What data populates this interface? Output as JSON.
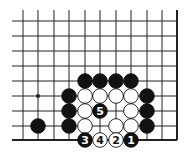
{
  "diagram": {
    "type": "go-board-fragment",
    "grid": {
      "x_lines": [
        23,
        38,
        54,
        69,
        85,
        100,
        116,
        131,
        147,
        162,
        177
      ],
      "y_lines": [
        21,
        36,
        51,
        66,
        81,
        96,
        111,
        126,
        140
      ],
      "left_extent": 12,
      "top_extent": 10,
      "right_edge_col": 10,
      "bottom_edge_row": 8
    },
    "star_points": [
      {
        "col": 1,
        "row": 5
      }
    ],
    "stones": [
      {
        "col": 4,
        "row": 4,
        "color": "black",
        "label": ""
      },
      {
        "col": 5,
        "row": 4,
        "color": "black",
        "label": ""
      },
      {
        "col": 6,
        "row": 4,
        "color": "black",
        "label": ""
      },
      {
        "col": 7,
        "row": 4,
        "color": "black",
        "label": ""
      },
      {
        "col": 3,
        "row": 5,
        "color": "black",
        "label": ""
      },
      {
        "col": 4,
        "row": 5,
        "color": "white",
        "label": ""
      },
      {
        "col": 5,
        "row": 5,
        "color": "white",
        "label": ""
      },
      {
        "col": 6,
        "row": 5,
        "color": "white",
        "label": ""
      },
      {
        "col": 7,
        "row": 5,
        "color": "white",
        "label": ""
      },
      {
        "col": 8,
        "row": 5,
        "color": "black",
        "label": ""
      },
      {
        "col": 3,
        "row": 6,
        "color": "black",
        "label": ""
      },
      {
        "col": 4,
        "row": 6,
        "color": "white",
        "label": ""
      },
      {
        "col": 5,
        "row": 6,
        "color": "black",
        "label": "5"
      },
      {
        "col": 7,
        "row": 6,
        "color": "white",
        "label": ""
      },
      {
        "col": 8,
        "row": 6,
        "color": "black",
        "label": ""
      },
      {
        "col": 1,
        "row": 7,
        "color": "black",
        "label": ""
      },
      {
        "col": 3,
        "row": 7,
        "color": "black",
        "label": ""
      },
      {
        "col": 4,
        "row": 7,
        "color": "white",
        "label": ""
      },
      {
        "col": 6,
        "row": 7,
        "color": "white",
        "label": ""
      },
      {
        "col": 7,
        "row": 7,
        "color": "white",
        "label": ""
      },
      {
        "col": 8,
        "row": 7,
        "color": "black",
        "label": ""
      },
      {
        "col": 4,
        "row": 8,
        "color": "black",
        "label": "3"
      },
      {
        "col": 5,
        "row": 8,
        "color": "white",
        "label": "4"
      },
      {
        "col": 6,
        "row": 8,
        "color": "white",
        "label": "2"
      },
      {
        "col": 7,
        "row": 8,
        "color": "black",
        "label": "1"
      }
    ],
    "colors": {
      "line": "#222222",
      "black_stone": "#111111",
      "white_stone": "#ffffff",
      "background": "#ffffff"
    }
  }
}
